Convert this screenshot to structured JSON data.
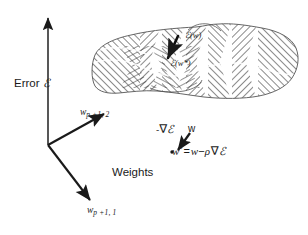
{
  "figure": {
    "background_color": "#ffffff",
    "ink_color": "#1a1a1a",
    "width": 308,
    "height": 235
  },
  "axes": {
    "vertical": {
      "label_prefix": "Error ",
      "label_symbol": "ℰ",
      "direction": "up"
    },
    "weight_axis_2": {
      "base": "w",
      "subscript": "p +1, 2",
      "direction": "upper-right"
    },
    "weight_axis_1": {
      "base": "w",
      "subscript": "p +1, 1",
      "direction": "lower-right"
    },
    "plane_label": "Weights"
  },
  "surface": {
    "name": "error-surface",
    "fill": "hatched",
    "hatch_color": "#333333",
    "outline_color": "#555555",
    "description": "wavy hatched error surface with a valley"
  },
  "surface_annotations": {
    "error_at_w": {
      "symbol": "ℰ",
      "argument": "(w)"
    },
    "error_at_w_star": {
      "symbol": "ℰ",
      "argument": "(w*)"
    },
    "descent_arrow": "downhill-gradient-arrow"
  },
  "equation_block": {
    "gradient_label_minus": "-",
    "gradient_label_nabla": "∇",
    "gradient_label_symbol": "ℰ",
    "current_point_label": "w",
    "new_point_label": "w",
    "new_point_star": "*",
    "equals": "=",
    "rhs_w": "w",
    "rhs_minus": "−",
    "rhs_rho": "ρ",
    "rhs_nabla": "∇",
    "rhs_eps": "ℰ",
    "full_equation": "w* = w − ρ ∇ℰ"
  }
}
